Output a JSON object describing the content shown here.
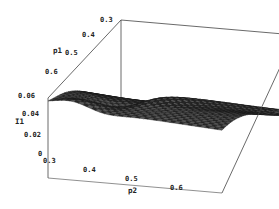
{
  "chart_data": {
    "type": "surface3d",
    "title": "",
    "xlabel": "p2",
    "ylabel": "p1",
    "zlabel": "I1",
    "x_ticks": [
      "0.3",
      "0.4",
      "0.5",
      "0.6"
    ],
    "y_ticks": [
      "0.3",
      "0.4",
      "0.5",
      "0.6"
    ],
    "z_ticks": [
      "0",
      "0.02",
      "0.04",
      "0.06"
    ],
    "xlim": [
      0.3,
      0.7
    ],
    "ylim": [
      0.3,
      0.7
    ],
    "zlim": [
      0,
      0.065
    ],
    "grid": false,
    "box": true,
    "legend": null,
    "surface_description": "Mesh surface peaking (~0.06) along the p1≈0.6-0.7 edge near p2≈0.3, with a saddle/dip around p1≈0.55, p2≈0.4, a ridge running diagonally toward p2≈0.6, falling to ~0 at p1≈0.3 across the back and front-right edges.",
    "sample_points": [
      {
        "p2": 0.3,
        "p1": 0.7,
        "I1": 0.06
      },
      {
        "p2": 0.3,
        "p1": 0.6,
        "I1": 0.058
      },
      {
        "p2": 0.3,
        "p1": 0.5,
        "I1": 0.045
      },
      {
        "p2": 0.3,
        "p1": 0.4,
        "I1": 0.02
      },
      {
        "p2": 0.3,
        "p1": 0.3,
        "I1": 0.0
      },
      {
        "p2": 0.4,
        "p1": 0.7,
        "I1": 0.055
      },
      {
        "p2": 0.4,
        "p1": 0.55,
        "I1": 0.048
      },
      {
        "p2": 0.4,
        "p1": 0.4,
        "I1": 0.02
      },
      {
        "p2": 0.5,
        "p1": 0.7,
        "I1": 0.057
      },
      {
        "p2": 0.5,
        "p1": 0.5,
        "I1": 0.035
      },
      {
        "p2": 0.5,
        "p1": 0.35,
        "I1": 0.012
      },
      {
        "p2": 0.6,
        "p1": 0.7,
        "I1": 0.055
      },
      {
        "p2": 0.6,
        "p1": 0.5,
        "I1": 0.03
      },
      {
        "p2": 0.6,
        "p1": 0.3,
        "I1": 0.0
      },
      {
        "p2": 0.7,
        "p1": 0.7,
        "I1": 0.05
      },
      {
        "p2": 0.7,
        "p1": 0.3,
        "I1": 0.0
      }
    ]
  },
  "colors": {
    "mesh": "#1a1a1a",
    "mesh_fill": "#3a3a3a",
    "box": "#444444",
    "background": "#ffffff"
  }
}
